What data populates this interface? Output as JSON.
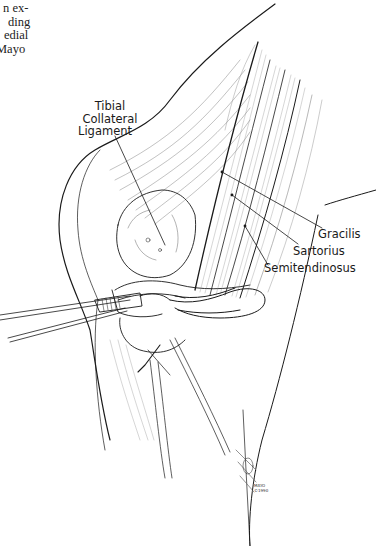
{
  "page_text_fragment": {
    "lines": [
      "n ex-",
      "ding",
      "edial",
      "Mayo"
    ]
  },
  "figure": {
    "labels": {
      "tibial_collateral_ligament": [
        "Tibial",
        "Collateral",
        "Ligament"
      ],
      "gracilis": "Gracilis",
      "sartorius": "Sartorius",
      "semitendinosus": "Semitendinosus"
    },
    "credit": [
      "MAYO",
      "©1990"
    ],
    "colors": {
      "ink": "#1a1a1a",
      "paper": "#ffffff",
      "hatch": "#777777"
    }
  }
}
